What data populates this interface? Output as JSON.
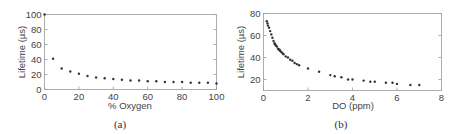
{
  "chart_data": [
    {
      "type": "scatter",
      "panel": "a",
      "caption": "(a)",
      "title": "",
      "xlabel": "% Oxygen",
      "ylabel": "Lifetime  (µs)",
      "xlim": [
        0,
        100
      ],
      "ylim": [
        0,
        100
      ],
      "xticks": [
        0,
        20,
        40,
        60,
        80,
        100
      ],
      "yticks": [
        0,
        20,
        40,
        60,
        80,
        100
      ],
      "grid": false,
      "x": [
        0,
        5,
        10,
        15,
        20,
        25,
        30,
        35,
        40,
        45,
        50,
        55,
        60,
        65,
        70,
        75,
        80,
        85,
        90,
        95,
        100
      ],
      "y": [
        100,
        41,
        28,
        24,
        21,
        18,
        16,
        15,
        14,
        13,
        12,
        12,
        11,
        11,
        10,
        10,
        10,
        9,
        9,
        9,
        8
      ]
    },
    {
      "type": "scatter",
      "panel": "b",
      "caption": "(b)",
      "title": "",
      "xlabel": "DO (ppm)",
      "ylabel": "Lifetime  (µs)",
      "xlim": [
        0,
        8
      ],
      "ylim": [
        10,
        80
      ],
      "xticks": [
        0,
        2,
        4,
        6,
        8
      ],
      "yticks": [
        20,
        40,
        60,
        80
      ],
      "grid": false,
      "x": [
        0.15,
        0.18,
        0.2,
        0.25,
        0.3,
        0.35,
        0.4,
        0.45,
        0.5,
        0.52,
        0.55,
        0.6,
        0.65,
        0.7,
        0.72,
        0.75,
        0.8,
        0.85,
        0.9,
        1.0,
        1.1,
        1.2,
        1.3,
        1.4,
        1.5,
        1.6,
        2.0,
        2.5,
        3.0,
        3.2,
        3.5,
        3.8,
        4.0,
        4.5,
        4.8,
        5.0,
        5.5,
        5.8,
        6.0,
        6.6,
        7.0
      ],
      "y": [
        73,
        71,
        69,
        67,
        64,
        61,
        58,
        55,
        53,
        52,
        51,
        50,
        48,
        47,
        47,
        46,
        45,
        44,
        43,
        41,
        40,
        38,
        37,
        35,
        34,
        33,
        30,
        27,
        24,
        23,
        22,
        20,
        20,
        19,
        18,
        18,
        17,
        17,
        16,
        15,
        15
      ]
    }
  ]
}
